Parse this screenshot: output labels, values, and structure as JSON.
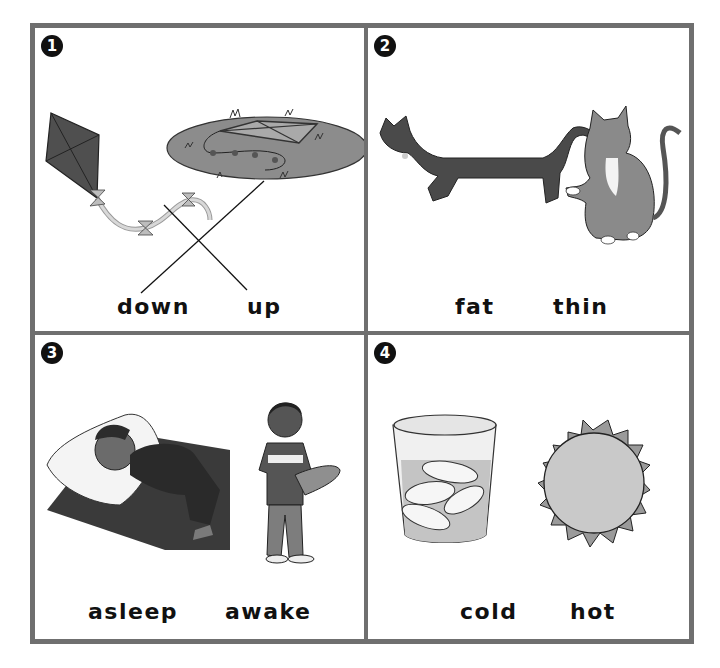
{
  "worksheet": {
    "panels": [
      {
        "number": "1",
        "words": [
          "down",
          "up"
        ],
        "pictures": [
          "kite flying in the air",
          "kite lying on the grass"
        ],
        "matching_lines": [
          {
            "from": "down",
            "to": "kite on grass"
          },
          {
            "from": "up",
            "to": "kite flying"
          }
        ]
      },
      {
        "number": "2",
        "words": [
          "fat",
          "thin"
        ],
        "pictures": [
          "long thin dark cat",
          "chubby striped cat"
        ]
      },
      {
        "number": "3",
        "words": [
          "asleep",
          "awake"
        ],
        "pictures": [
          "boy sleeping on a pillow",
          "boy standing with skateboard"
        ]
      },
      {
        "number": "4",
        "words": [
          "cold",
          "hot"
        ],
        "pictures": [
          "glass of ice water",
          "sun"
        ]
      }
    ]
  },
  "colors": {
    "border": "#6f6f6f",
    "ink": "#111111",
    "art_dark": "#4a4a4a",
    "art_mid": "#8a8a8a",
    "art_light": "#c8c8c8"
  }
}
